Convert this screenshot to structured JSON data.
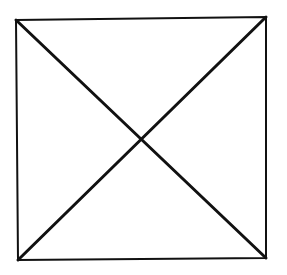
{
  "diagram": {
    "type": "geometric-figure",
    "shape": "square-with-diagonals",
    "background": "#ffffff",
    "stroke_color": "#111111",
    "square": {
      "corners": {
        "top_left": [
          16,
          20
        ],
        "top_right": [
          266,
          17
        ],
        "bottom_right": [
          266,
          258
        ],
        "bottom_left": [
          18,
          260
        ]
      },
      "stroke_width": 2
    },
    "diagonals": [
      {
        "name": "top-left-to-bottom-right",
        "from": [
          16,
          20
        ],
        "to": [
          266,
          258
        ],
        "stroke_width": 3
      },
      {
        "name": "top-right-to-bottom-left",
        "from": [
          266,
          17
        ],
        "to": [
          18,
          260
        ],
        "stroke_width": 3
      }
    ],
    "intersection": [
      141,
      139
    ]
  }
}
